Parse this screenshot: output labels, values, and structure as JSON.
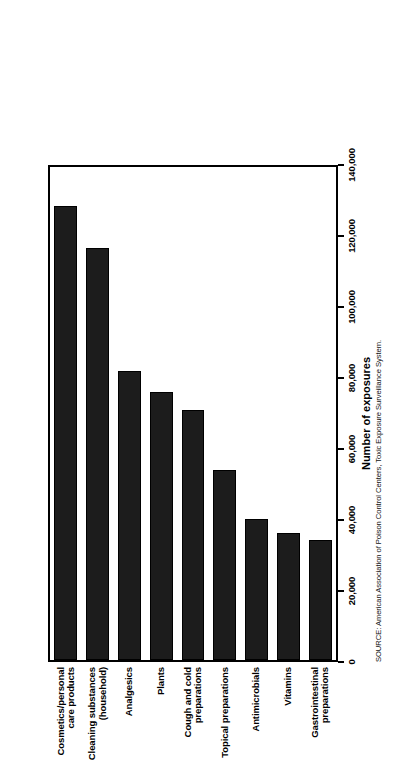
{
  "chart_data": {
    "type": "bar",
    "orientation": "vertical-rotated",
    "title": "",
    "xlabel": "",
    "ylabel": "Number of exposures",
    "ylim": [
      0,
      140000
    ],
    "grid": false,
    "legend": null,
    "categories": [
      "Cosmetics/personal\ncare products",
      "Cleaning substances\n(household)",
      "Analgesics",
      "Plants",
      "Cough and cold\npreparations",
      "Topical preparations",
      "Antimicrobials",
      "Vitamins",
      "Gastrointestinal\npreparations"
    ],
    "values": [
      129000,
      117000,
      82000,
      76000,
      71000,
      54000,
      40000,
      36000,
      34000
    ],
    "tick_values": [
      0,
      20000,
      40000,
      60000,
      80000,
      100000,
      120000,
      140000
    ],
    "tick_labels": [
      "0",
      "20,000",
      "40,000",
      "60,000",
      "80,000",
      "100,000",
      "120,000",
      "140,000"
    ],
    "bar_color": "#1c1c1c",
    "source_note": "SOURCE: American Association of Poison Control Centers, Toxic Exposure Surveillance System."
  },
  "axis": {
    "value_axis_title": "Number of exposures"
  },
  "footer": {
    "source": "SOURCE: American Association of Poison Control Centers, Toxic Exposure Surveillance System."
  }
}
